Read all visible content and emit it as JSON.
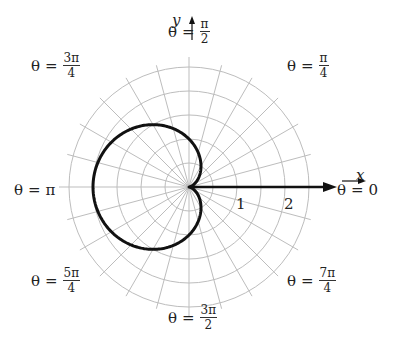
{
  "figure": {
    "center": [
      189,
      187
    ],
    "unit_px": 48,
    "grid": {
      "ring_step": 0.5,
      "ring_count": 5,
      "spoke_step_deg": 15,
      "color": "#bdbdbd"
    },
    "curve": {
      "equation": "r = 1 - cos(theta)",
      "a": 1,
      "color": "#111111",
      "stroke_width": 3
    },
    "axes": {
      "x_label": "x",
      "y_label": "y",
      "tick_labels": [
        "1",
        "2"
      ]
    },
    "angle_labels": [
      {
        "id": "0",
        "theta": "θ",
        "eq": "=",
        "whole": "0",
        "num": "",
        "den": "",
        "x": 337,
        "y": 193
      },
      {
        "id": "pi-4",
        "theta": "θ",
        "eq": "=",
        "whole": "",
        "num": "π",
        "den": "4",
        "x": 287,
        "y": 68
      },
      {
        "id": "pi-2",
        "theta": "θ",
        "eq": "=",
        "whole": "",
        "num": "π",
        "den": "2",
        "x": 168,
        "y": 34
      },
      {
        "id": "3pi-4",
        "theta": "θ",
        "eq": "=",
        "whole": "",
        "num": "3π",
        "den": "4",
        "x": 31,
        "y": 68
      },
      {
        "id": "pi",
        "theta": "θ",
        "eq": "=",
        "whole": "π",
        "num": "",
        "den": "",
        "x": 14,
        "y": 193
      },
      {
        "id": "5pi-4",
        "theta": "θ",
        "eq": "=",
        "whole": "",
        "num": "5π",
        "den": "4",
        "x": 31,
        "y": 283
      },
      {
        "id": "3pi-2",
        "theta": "θ",
        "eq": "=",
        "whole": "",
        "num": "3π",
        "den": "2",
        "x": 168,
        "y": 320
      },
      {
        "id": "7pi-4",
        "theta": "θ",
        "eq": "=",
        "whole": "",
        "num": "7π",
        "den": "4",
        "x": 287,
        "y": 283
      }
    ]
  },
  "chart_data": {
    "type": "polar-line",
    "title": "",
    "series": [
      {
        "name": "r = 1 - cos θ",
        "equation": "r = 1 - cos(theta)",
        "theta_range": [
          0,
          6.2832
        ]
      }
    ],
    "sample_points": [
      {
        "theta": "0",
        "r": 0
      },
      {
        "theta": "π/2",
        "r": 1
      },
      {
        "theta": "π",
        "r": 2
      },
      {
        "theta": "3π/2",
        "r": 1
      }
    ],
    "radial_ticks": [
      1,
      2
    ],
    "radial_max": 2.5,
    "angle_labels": [
      "θ = 0",
      "θ = π/4",
      "θ = π/2",
      "θ = 3π/4",
      "θ = π",
      "θ = 5π/4",
      "θ = 3π/2",
      "θ = 7π/4"
    ],
    "xlabel": "x",
    "ylabel": "y",
    "grid": true
  }
}
